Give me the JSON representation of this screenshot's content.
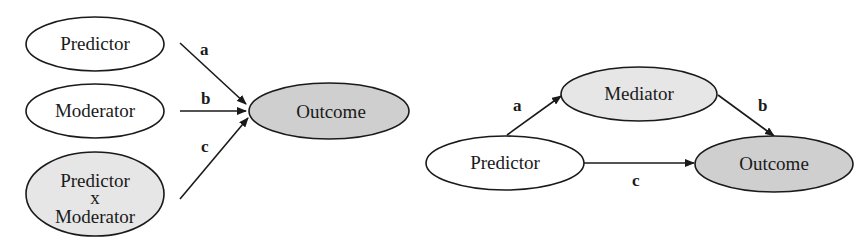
{
  "colors": {
    "white_fill": "#ffffff",
    "light_gray_fill": "#e6e6e6",
    "gray_fill": "#cfcfcf",
    "stroke": "#1a1a1a"
  },
  "moderation_model": {
    "nodes": {
      "predictor": "Predictor",
      "moderator": "Moderator",
      "interaction_line1": "Predictor",
      "interaction_line2": "x",
      "interaction_line3": "Moderator",
      "outcome": "Outcome"
    },
    "paths": {
      "a": "a",
      "b": "b",
      "c": "c"
    }
  },
  "mediation_model": {
    "nodes": {
      "predictor": "Predictor",
      "mediator": "Mediator",
      "outcome": "Outcome"
    },
    "paths": {
      "a": "a",
      "b": "b",
      "c": "c"
    }
  }
}
